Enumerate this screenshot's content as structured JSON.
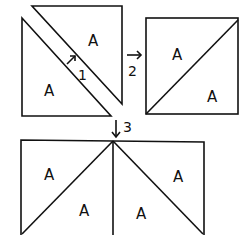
{
  "diagram": {
    "title": "",
    "patch_label": "A",
    "steps": [
      {
        "number": "1",
        "description": "arrow pointing to separated triangles"
      },
      {
        "number": "2",
        "description": "right arrow to assembled half-square triangle"
      },
      {
        "number": "3",
        "description": "down arrow to two joined half-square triangles"
      }
    ],
    "panels": [
      {
        "name": "step-1-separated-triangles",
        "labels": [
          "A",
          "A"
        ]
      },
      {
        "name": "step-2-half-square-triangle",
        "labels": [
          "A",
          "A"
        ]
      },
      {
        "name": "step-3-joined-blocks",
        "labels": [
          "A",
          "A",
          "A",
          "A"
        ]
      }
    ],
    "colors": {
      "line": "#111111",
      "background": "#ffffff"
    }
  }
}
